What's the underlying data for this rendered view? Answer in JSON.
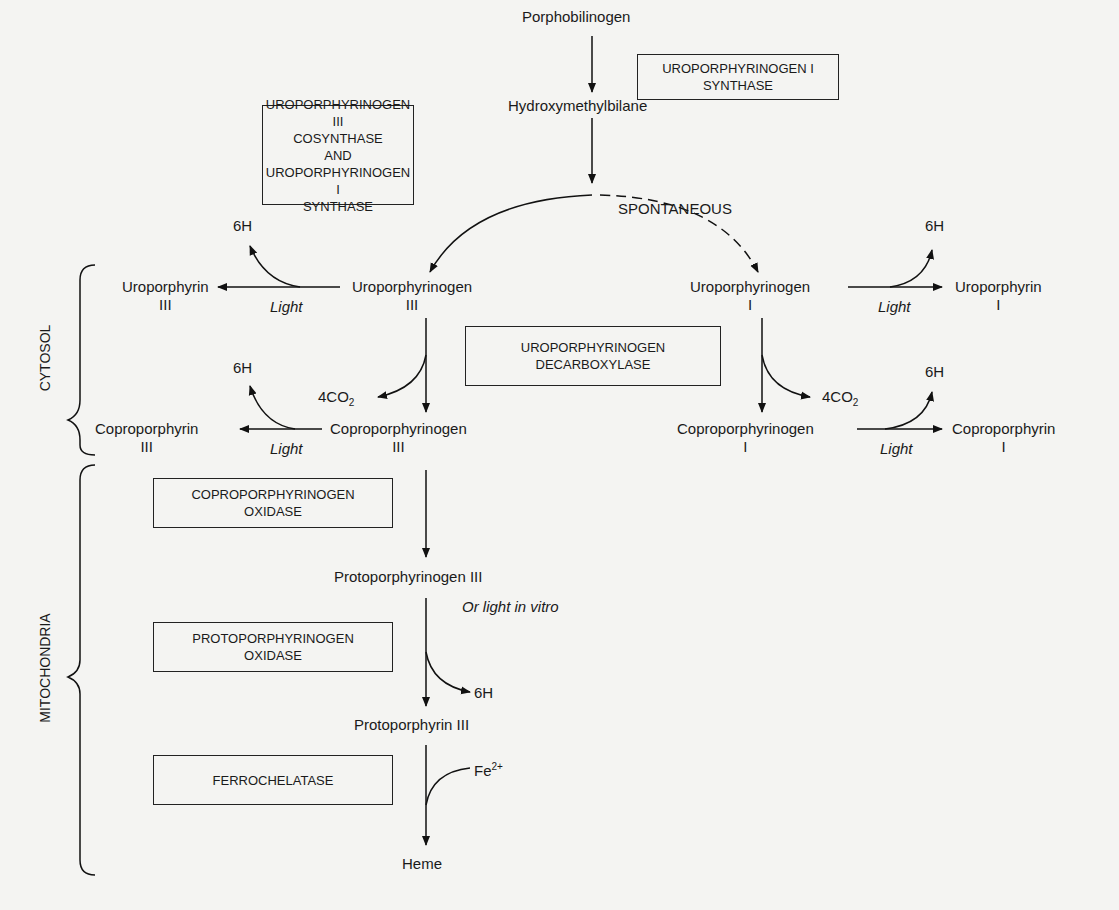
{
  "compartments": {
    "cytosol": "CYTOSOL",
    "mitochondria": "MITOCHONDRIA"
  },
  "enzymes": {
    "uro1_synthase": [
      "UROPORPHYRINOGEN I",
      "SYNTHASE"
    ],
    "uro3_cosynthase": [
      "UROPORPHYRINOGEN III",
      "COSYNTHASE",
      "AND",
      "UROPORPHYRINOGEN I",
      "SYNTHASE"
    ],
    "uro_decarboxylase": [
      "UROPORPHYRINOGEN",
      "DECARBOXYLASE"
    ],
    "copro_oxidase": [
      "COPROPORPHYRINOGEN",
      "OXIDASE"
    ],
    "proto_oxidase": [
      "PROTOPORPHYRINOGEN",
      "OXIDASE"
    ],
    "ferrochelatase": [
      "FERROCHELATASE"
    ]
  },
  "metabolites": {
    "porphobilinogen": "Porphobilinogen",
    "hydroxymethylbilane": "Hydroxymethylbilane",
    "uroporphyrinogen3": {
      "name": "Uroporphyrinogen",
      "isomer": "III"
    },
    "uroporphyrinogen1": {
      "name": "Uroporphyrinogen",
      "isomer": "I"
    },
    "uroporphyrin3": {
      "name": "Uroporphyrin",
      "isomer": "III"
    },
    "uroporphyrin1": {
      "name": "Uroporphyrin",
      "isomer": "I"
    },
    "coproporphyrinogen3": {
      "name": "Coproporphyrinogen",
      "isomer": "III"
    },
    "coproporphyrinogen1": {
      "name": "Coproporphyrinogen",
      "isomer": "I"
    },
    "coproporphyrin3": {
      "name": "Coproporphyrin",
      "isomer": "III"
    },
    "coproporphyrin1": {
      "name": "Coproporphyrin",
      "isomer": "I"
    },
    "protoporphyrinogen3": "Protoporphyrinogen III",
    "protoporphyrin3": "Protoporphyrin III",
    "heme": "Heme"
  },
  "annotations": {
    "spontaneous": "SPONTANEOUS",
    "light": "Light",
    "or_light_in_vitro": "Or light in vitro",
    "six_h": "6H",
    "four_co2_base": "4CO",
    "four_co2_sub": "2",
    "fe_base": "Fe",
    "fe_sup": "2+"
  }
}
